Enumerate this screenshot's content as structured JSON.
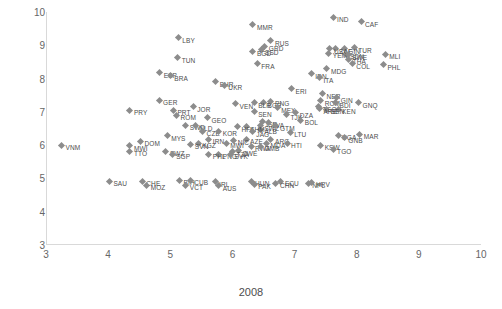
{
  "chart_data": {
    "type": "scatter",
    "title": "",
    "xlabel": "2008",
    "ylabel": "2013",
    "xlim": [
      3,
      10
    ],
    "ylim": [
      3,
      10
    ],
    "xticks": [
      3,
      4,
      5,
      6,
      7,
      8,
      9,
      10
    ],
    "yticks": [
      3,
      4,
      5,
      6,
      7,
      8,
      9,
      10
    ],
    "grid": false,
    "legend": "none",
    "marker": "diamond",
    "marker_color": "#8c8c8c",
    "points": [
      {
        "label": "MMR",
        "x": 6.33,
        "y": 9.62
      },
      {
        "label": "IND",
        "x": 7.62,
        "y": 9.84
      },
      {
        "label": "CAF",
        "x": 8.07,
        "y": 9.7
      },
      {
        "label": "LBY",
        "x": 5.13,
        "y": 9.22
      },
      {
        "label": "RUS",
        "x": 6.62,
        "y": 9.13
      },
      {
        "label": "GRD",
        "x": 6.52,
        "y": 8.97
      },
      {
        "label": "SSD",
        "x": 6.46,
        "y": 8.86
      },
      {
        "label": "BGD",
        "x": 6.33,
        "y": 8.82
      },
      {
        "label": "TUR",
        "x": 7.96,
        "y": 8.93
      },
      {
        "label": "ZAF",
        "x": 7.66,
        "y": 8.9
      },
      {
        "label": "GIN",
        "x": 7.8,
        "y": 8.9
      },
      {
        "label": "USA",
        "x": 7.57,
        "y": 8.9
      },
      {
        "label": "SDN",
        "x": 7.83,
        "y": 8.73
      },
      {
        "label": "YEM",
        "x": 7.55,
        "y": 8.76
      },
      {
        "label": "SWE",
        "x": 7.86,
        "y": 8.72
      },
      {
        "label": "MLI",
        "x": 8.46,
        "y": 8.73
      },
      {
        "label": "THA",
        "x": 7.87,
        "y": 8.58
      },
      {
        "label": "COL",
        "x": 7.93,
        "y": 8.45
      },
      {
        "label": "PHL",
        "x": 8.43,
        "y": 8.42
      },
      {
        "label": "TUN",
        "x": 5.12,
        "y": 8.62
      },
      {
        "label": "FRA",
        "x": 6.4,
        "y": 8.45
      },
      {
        "label": "MDG",
        "x": 7.52,
        "y": 8.29
      },
      {
        "label": "ESP",
        "x": 4.83,
        "y": 8.18
      },
      {
        "label": "BRA",
        "x": 5.0,
        "y": 8.08
      },
      {
        "label": "IDN",
        "x": 7.27,
        "y": 8.15
      },
      {
        "label": "ITA",
        "x": 7.4,
        "y": 8.02
      },
      {
        "label": "BHR",
        "x": 5.73,
        "y": 7.9
      },
      {
        "label": "UKR",
        "x": 5.87,
        "y": 7.8
      },
      {
        "label": "ERI",
        "x": 6.95,
        "y": 7.7
      },
      {
        "label": "NER",
        "x": 7.45,
        "y": 7.55
      },
      {
        "label": "GER",
        "x": 4.82,
        "y": 7.35
      },
      {
        "label": "BGR",
        "x": 6.5,
        "y": 7.28
      },
      {
        "label": "PNG",
        "x": 6.62,
        "y": 7.32
      },
      {
        "label": "VEN",
        "x": 6.05,
        "y": 7.25
      },
      {
        "label": "BLR",
        "x": 6.35,
        "y": 7.28
      },
      {
        "label": "GIN2",
        "x": 7.68,
        "y": 7.43
      },
      {
        "label": "ROM",
        "x": 7.42,
        "y": 7.33
      },
      {
        "label": "BDI",
        "x": 7.66,
        "y": 7.28
      },
      {
        "label": "GNQ",
        "x": 8.03,
        "y": 7.27
      },
      {
        "label": "JOR",
        "x": 5.37,
        "y": 7.15
      },
      {
        "label": "PRT",
        "x": 5.05,
        "y": 7.05
      },
      {
        "label": "PRY",
        "x": 4.35,
        "y": 7.05
      },
      {
        "label": "MEX",
        "x": 6.72,
        "y": 7.12
      },
      {
        "label": "SEN",
        "x": 6.35,
        "y": 7.0
      },
      {
        "label": "TGO2",
        "x": 7.38,
        "y": 7.15
      },
      {
        "label": "KEN",
        "x": 7.7,
        "y": 7.08
      },
      {
        "label": "BEN",
        "x": 7.52,
        "y": 7.08
      },
      {
        "label": "ARE",
        "x": 7.4,
        "y": 7.1
      },
      {
        "label": "ROM2",
        "x": 5.1,
        "y": 6.9
      },
      {
        "label": "TJK",
        "x": 6.87,
        "y": 6.92
      },
      {
        "label": "DZA",
        "x": 7.02,
        "y": 6.97
      },
      {
        "label": "GEO",
        "x": 5.6,
        "y": 6.82
      },
      {
        "label": "BOL",
        "x": 7.1,
        "y": 6.75
      },
      {
        "label": "ISR",
        "x": 6.48,
        "y": 6.7
      },
      {
        "label": "LVA",
        "x": 6.58,
        "y": 6.68
      },
      {
        "label": "SWZ2",
        "x": 6.45,
        "y": 6.58
      },
      {
        "label": "GTM",
        "x": 6.7,
        "y": 6.58
      },
      {
        "label": "ALB",
        "x": 6.45,
        "y": 6.48
      },
      {
        "label": "KHM",
        "x": 6.22,
        "y": 6.55
      },
      {
        "label": "HFA",
        "x": 6.08,
        "y": 6.55
      },
      {
        "label": "SWD",
        "x": 5.25,
        "y": 6.6
      },
      {
        "label": "NLD",
        "x": 5.4,
        "y": 6.58
      },
      {
        "label": "MYS",
        "x": 4.95,
        "y": 6.28
      },
      {
        "label": "CZE",
        "x": 5.52,
        "y": 6.42
      },
      {
        "label": "KOR",
        "x": 5.78,
        "y": 6.42
      },
      {
        "label": "JAG",
        "x": 6.32,
        "y": 6.4
      },
      {
        "label": "LTU",
        "x": 6.93,
        "y": 6.38
      },
      {
        "label": "UGA",
        "x": 7.7,
        "y": 6.3
      },
      {
        "label": "GNB",
        "x": 7.8,
        "y": 6.22
      },
      {
        "label": "MAR",
        "x": 8.05,
        "y": 6.32
      },
      {
        "label": "IRN",
        "x": 5.62,
        "y": 6.18
      },
      {
        "label": "AZE",
        "x": 6.22,
        "y": 6.18
      },
      {
        "label": "NIC",
        "x": 6.02,
        "y": 6.15
      },
      {
        "label": "ARG",
        "x": 6.62,
        "y": 6.18
      },
      {
        "label": "MDA",
        "x": 6.55,
        "y": 6.05
      },
      {
        "label": "HTI",
        "x": 6.88,
        "y": 6.05
      },
      {
        "label": "KGZ",
        "x": 5.45,
        "y": 6.05
      },
      {
        "label": "SVN",
        "x": 5.33,
        "y": 6.02
      },
      {
        "label": "MWI2",
        "x": 5.9,
        "y": 6.05
      },
      {
        "label": "DOM",
        "x": 4.52,
        "y": 6.12
      },
      {
        "label": "MWI",
        "x": 4.35,
        "y": 5.98
      },
      {
        "label": "VNM",
        "x": 3.25,
        "y": 6.0
      },
      {
        "label": "KSW",
        "x": 7.42,
        "y": 6.0
      },
      {
        "label": "TGO",
        "x": 7.62,
        "y": 5.87
      },
      {
        "label": "RWA",
        "x": 6.3,
        "y": 5.97
      },
      {
        "label": "GMB",
        "x": 6.45,
        "y": 5.97
      },
      {
        "label": "ZWE",
        "x": 6.1,
        "y": 5.83
      },
      {
        "label": "TTO",
        "x": 4.35,
        "y": 5.82
      },
      {
        "label": "SWZ",
        "x": 4.93,
        "y": 5.82
      },
      {
        "label": "SGP",
        "x": 5.03,
        "y": 5.72
      },
      {
        "label": "TZA",
        "x": 6.0,
        "y": 5.8
      },
      {
        "label": "PNG2",
        "x": 5.78,
        "y": 5.72
      },
      {
        "label": "SVK",
        "x": 5.97,
        "y": 5.72
      },
      {
        "label": "PHL2",
        "x": 5.62,
        "y": 5.72
      },
      {
        "label": "SAU",
        "x": 4.02,
        "y": 4.92
      },
      {
        "label": "CHE",
        "x": 4.55,
        "y": 4.92
      },
      {
        "label": "MOZ",
        "x": 4.62,
        "y": 4.8
      },
      {
        "label": "BIH",
        "x": 5.15,
        "y": 4.95
      },
      {
        "label": "CUB",
        "x": 5.32,
        "y": 4.95
      },
      {
        "label": "VCT",
        "x": 5.25,
        "y": 4.8
      },
      {
        "label": "IRL",
        "x": 5.72,
        "y": 4.9
      },
      {
        "label": "AUS",
        "x": 5.78,
        "y": 4.78
      },
      {
        "label": "HUN",
        "x": 6.3,
        "y": 4.92
      },
      {
        "label": "PAK",
        "x": 6.35,
        "y": 4.82
      },
      {
        "label": "ECU",
        "x": 6.78,
        "y": 4.92
      },
      {
        "label": "CHN",
        "x": 6.7,
        "y": 4.85
      },
      {
        "label": "NPL",
        "x": 7.22,
        "y": 4.85
      },
      {
        "label": "HRV",
        "x": 7.28,
        "y": 4.88
      }
    ]
  }
}
